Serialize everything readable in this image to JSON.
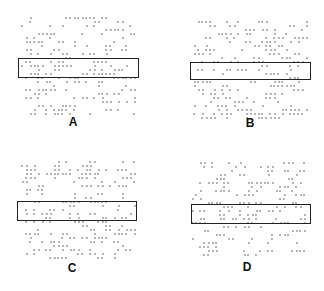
{
  "figure": {
    "panels": [
      {
        "label": "A",
        "frame": {
          "x": 18,
          "y": 58,
          "w": 121,
          "h": 20
        },
        "label_pos": {
          "x": 73,
          "y": 122
        }
      },
      {
        "label": "B",
        "frame": {
          "x": 190,
          "y": 62,
          "w": 121,
          "h": 18
        },
        "label_pos": {
          "x": 250,
          "y": 123
        }
      },
      {
        "label": "C",
        "frame": {
          "x": 17,
          "y": 201,
          "w": 120,
          "h": 20
        },
        "label_pos": {
          "x": 72,
          "y": 268
        }
      },
      {
        "label": "D",
        "frame": {
          "x": 191,
          "y": 204,
          "w": 120,
          "h": 20
        },
        "label_pos": {
          "x": 247,
          "y": 267
        }
      }
    ],
    "dot_color": "#444444",
    "frame_color": "#222222"
  }
}
